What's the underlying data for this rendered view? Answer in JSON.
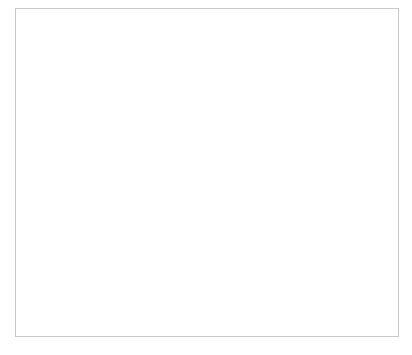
{
  "figure": {
    "caption_fragment": "",
    "frame_color": "#c9c9c9",
    "background": "#ffffff"
  },
  "chart_data": {
    "type": "line",
    "title": "",
    "subtitle": "",
    "xlabel": "Year",
    "ylabel": "Percentage",
    "categories": [
      "1947",
      "1954",
      "1958",
      "1963",
      "1967",
      "1972",
      "1977"
    ],
    "values": [
      56.5,
      61.5,
      65.5,
      66.8,
      72.4,
      75.0,
      77.0
    ],
    "series": [
      {
        "name": "Percentage",
        "values": [
          56.5,
          61.5,
          65.5,
          66.8,
          72.4,
          75.0,
          77.0
        ],
        "color": "#4a4a4a",
        "marker": "circle",
        "marker_size": 5
      }
    ],
    "ylim": [
      54,
      80
    ],
    "ytick_step": 2,
    "yticks": [
      54,
      56,
      58,
      60,
      62,
      64,
      66,
      68,
      70,
      72,
      74,
      76,
      78,
      80
    ],
    "xticks": [
      "1947",
      "1954",
      "1958",
      "1963",
      "1967",
      "1972",
      "1977"
    ],
    "x_scale": "categorical",
    "grid": false,
    "legend": false,
    "legend_position": "none",
    "axis_color": "#8c8c8c",
    "text_color": "#3b3b3b",
    "annotations": []
  }
}
